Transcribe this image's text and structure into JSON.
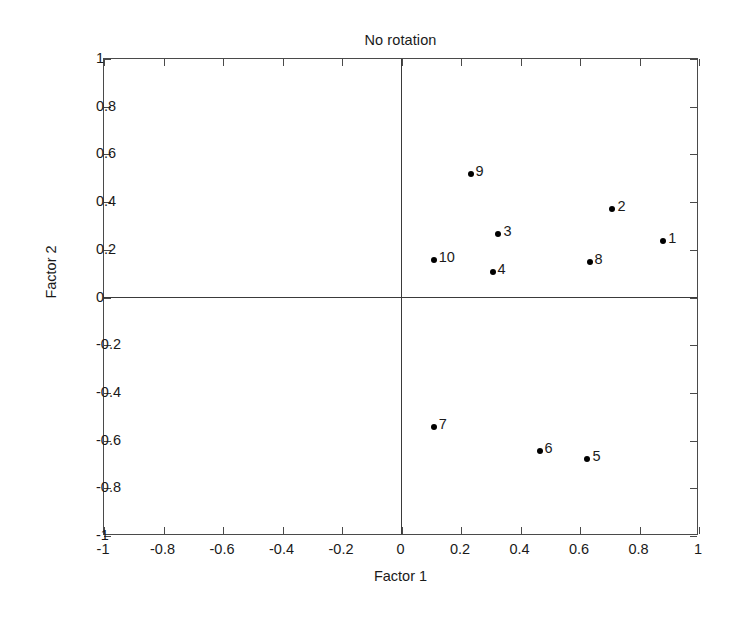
{
  "chart_data": {
    "type": "scatter",
    "title": "No rotation",
    "xlabel": "Factor 1",
    "ylabel": "Factor 2",
    "xlim": [
      -1,
      1
    ],
    "ylim": [
      -1,
      1
    ],
    "grid": false,
    "legend": null,
    "xticks": [
      "-1",
      "-0.8",
      "-0.6",
      "-0.4",
      "-0.2",
      "0",
      "0.2",
      "0.4",
      "0.6",
      "0.8",
      "1"
    ],
    "xtick_values": [
      -1,
      -0.8,
      -0.6,
      -0.4,
      -0.2,
      0,
      0.2,
      0.4,
      0.6,
      0.8,
      1
    ],
    "yticks": [
      "1",
      "0.8",
      "0.6",
      "0.4",
      "0.2",
      "0",
      "-0.2",
      "-0.4",
      "-0.6",
      "-0.8",
      "-1"
    ],
    "ytick_values": [
      1,
      0.8,
      0.6,
      0.4,
      0.2,
      0,
      -0.2,
      -0.4,
      -0.6,
      -0.8,
      -1
    ],
    "marker_color": "#000000",
    "axis_color": "#4a4a4a",
    "points": [
      {
        "label": "1",
        "x": 0.88,
        "y": 0.235
      },
      {
        "label": "2",
        "x": 0.709,
        "y": 0.369
      },
      {
        "label": "3",
        "x": 0.326,
        "y": 0.268
      },
      {
        "label": "4",
        "x": 0.306,
        "y": 0.109
      },
      {
        "label": "5",
        "x": 0.625,
        "y": -0.679
      },
      {
        "label": "6",
        "x": 0.464,
        "y": -0.645
      },
      {
        "label": "7",
        "x": 0.108,
        "y": -0.545
      },
      {
        "label": "8",
        "x": 0.632,
        "y": 0.147
      },
      {
        "label": "9",
        "x": 0.232,
        "y": 0.516
      },
      {
        "label": "10",
        "x": 0.108,
        "y": 0.159
      }
    ]
  }
}
